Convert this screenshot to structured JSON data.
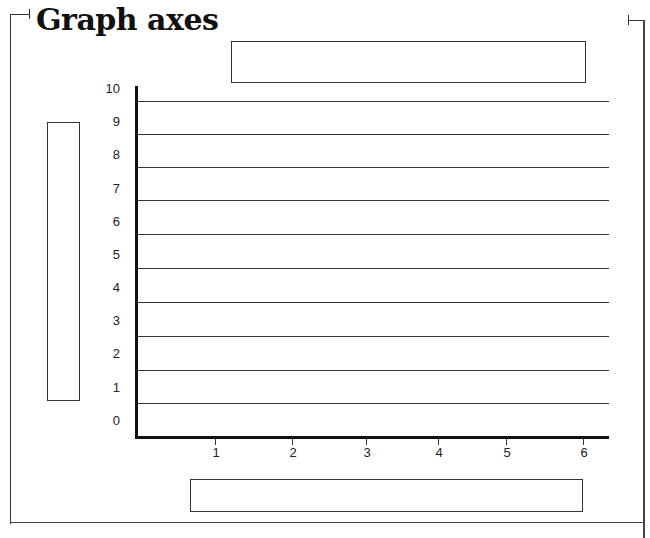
{
  "title": "Graph axes",
  "chart_data": {
    "type": "line",
    "title": "Graph axes",
    "xlabel": "",
    "ylabel": "",
    "x_ticks": [
      "1",
      "2",
      "3",
      "4",
      "5",
      "6"
    ],
    "y_ticks": [
      "0",
      "1",
      "2",
      "3",
      "4",
      "5",
      "6",
      "7",
      "8",
      "9",
      "10"
    ],
    "xlim": [
      0,
      6
    ],
    "ylim": [
      0,
      10
    ],
    "grid": "horizontal",
    "series": [],
    "label_boxes": [
      "title-box (blank)",
      "y-axis-label-box (blank)",
      "x-axis-label-box (blank)"
    ]
  }
}
